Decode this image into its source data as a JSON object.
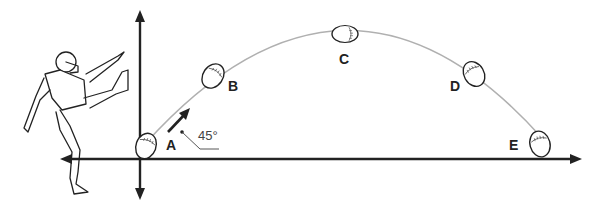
{
  "diagram": {
    "title": "",
    "angle_label": "45°",
    "points": [
      {
        "id": "A",
        "label": "A"
      },
      {
        "id": "B",
        "label": "B"
      },
      {
        "id": "C",
        "label": "C"
      },
      {
        "id": "D",
        "label": "D"
      },
      {
        "id": "E",
        "label": "E"
      }
    ],
    "colors": {
      "axes": "#222222",
      "trajectory": "#b0b0b0",
      "ball_outline": "#222222",
      "background": "#ffffff"
    }
  }
}
